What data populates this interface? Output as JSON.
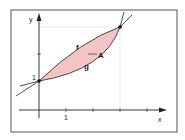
{
  "diagram": {
    "type": "area-between-curves",
    "axes": {
      "x_label": "x",
      "y_label": "y",
      "x_tick_label": "1",
      "y_tick_label": "1"
    },
    "curves": [
      {
        "name": "f",
        "label": "f",
        "shape": "concave",
        "color": "#222222"
      },
      {
        "name": "g",
        "label": "g",
        "shape": "convex",
        "color": "#222222"
      }
    ],
    "region": {
      "label": "A",
      "fill": "#f2c4c4"
    },
    "intersections": [
      {
        "x": 0,
        "y": 1
      },
      {
        "x": 3,
        "y": 3
      }
    ],
    "x_ticks": [
      1,
      2,
      3,
      4
    ],
    "y_ticks": [
      1,
      2,
      3
    ]
  },
  "colors": {
    "frame": "#555555",
    "axis": "#222222",
    "guide": "#bbbbbb",
    "area": "#f2c4c4"
  }
}
